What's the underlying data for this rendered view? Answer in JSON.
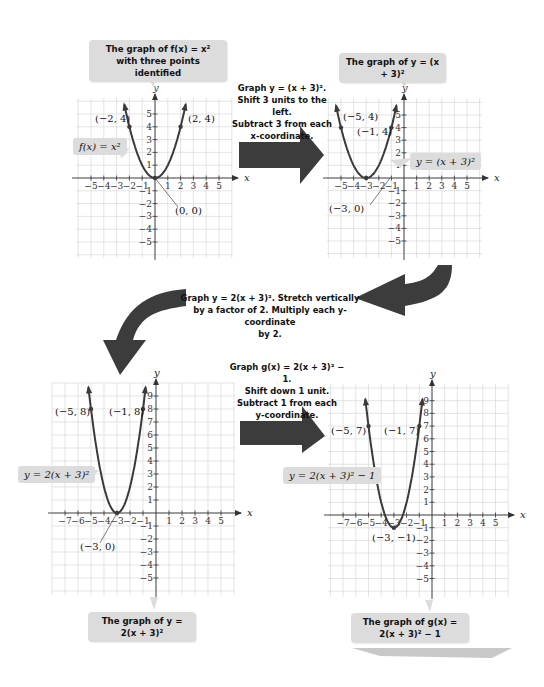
{
  "graphs": [
    {
      "id": "graph1",
      "caption": "The graph of f(x) = x² with three points identified",
      "caption_line1": "The graph of f(x) = x²",
      "caption_line2": "with three points identified",
      "equation_label": "f(x) = x²",
      "points": [
        {
          "label": "(−2, 4)",
          "x": -2,
          "y": 4
        },
        {
          "label": "(2, 4)",
          "x": 2,
          "y": 4
        },
        {
          "label": "(0, 0)",
          "x": 0,
          "y": 0
        }
      ],
      "x_ticks": [
        "−5",
        "−4",
        "−3",
        "−2",
        "−1",
        "1",
        "2",
        "3",
        "4",
        "5"
      ],
      "y_ticks": [
        "5",
        "4",
        "3",
        "2",
        "1",
        "−1",
        "−2",
        "−3",
        "−4",
        "−5"
      ],
      "axis_x": "x",
      "axis_y": "y"
    },
    {
      "id": "graph2",
      "caption": "The graph of y = (x + 3)²",
      "equation_label": "y = (x + 3)²",
      "points": [
        {
          "label": "(−5, 4)",
          "x": -5,
          "y": 4
        },
        {
          "label": "(−1, 4)",
          "x": -1,
          "y": 4
        },
        {
          "label": "(−3, 0)",
          "x": -3,
          "y": 0
        }
      ],
      "x_ticks": [
        "−5",
        "−4",
        "−3",
        "−2",
        "−1",
        "1",
        "2",
        "3",
        "4",
        "5"
      ],
      "y_ticks": [
        "5",
        "4",
        "3",
        "2",
        "1",
        "−1",
        "−2",
        "−3",
        "−4",
        "−5"
      ],
      "axis_x": "x",
      "axis_y": "y"
    },
    {
      "id": "graph3",
      "caption": "The graph of y = 2(x + 3)²",
      "equation_label": "y = 2(x + 3)²",
      "points": [
        {
          "label": "(−5, 8)",
          "x": -5,
          "y": 8
        },
        {
          "label": "(−1, 8)",
          "x": -1,
          "y": 8
        },
        {
          "label": "(−3, 0)",
          "x": -3,
          "y": 0
        }
      ],
      "x_ticks": [
        "−7",
        "−6",
        "−5",
        "−4",
        "−3",
        "−2",
        "−1",
        "1",
        "2",
        "3",
        "4",
        "5"
      ],
      "y_ticks": [
        "9",
        "8",
        "7",
        "6",
        "5",
        "4",
        "3",
        "2",
        "1",
        "−1",
        "−2",
        "−3",
        "−4",
        "−5"
      ],
      "axis_x": "x",
      "axis_y": "y"
    },
    {
      "id": "graph4",
      "caption": "The graph of g(x) = 2(x + 3)² − 1",
      "equation_label": "y = 2(x + 3)² − 1",
      "points": [
        {
          "label": "(−5, 7)",
          "x": -5,
          "y": 7
        },
        {
          "label": "(−1, 7)",
          "x": -1,
          "y": 7
        },
        {
          "label": "(−3, −1)",
          "x": -3,
          "y": -1
        }
      ],
      "x_ticks": [
        "−7",
        "−6",
        "−5",
        "−4",
        "−3",
        "−2",
        "−1",
        "1",
        "2",
        "3",
        "4",
        "5"
      ],
      "y_ticks": [
        "9",
        "8",
        "7",
        "6",
        "5",
        "4",
        "3",
        "2",
        "1",
        "−1",
        "−2",
        "−3",
        "−4",
        "−5"
      ],
      "axis_x": "x",
      "axis_y": "y"
    }
  ],
  "steps": [
    {
      "line1": "Graph y = (x + 3)².",
      "line2": "Shift 3 units to the left.",
      "line3": "Subtract 3 from each",
      "line4": "x-coordinate."
    },
    {
      "line1": "Graph y = 2(x + 3)². Stretch vertically",
      "line2": "by a factor of 2. Multiply each y-coordinate",
      "line3": "by 2."
    },
    {
      "line1": "Graph g(x) = 2(x + 3)² − 1.",
      "line2": "Shift down 1 unit.",
      "line3": "Subtract 1 from each",
      "line4": "y-coordinate."
    }
  ],
  "colors": {
    "curve": "#3a3a3a",
    "grid": "#d8d8d8",
    "callout_bg": "#dcdcdc",
    "arrow": "#3c3c3c"
  }
}
